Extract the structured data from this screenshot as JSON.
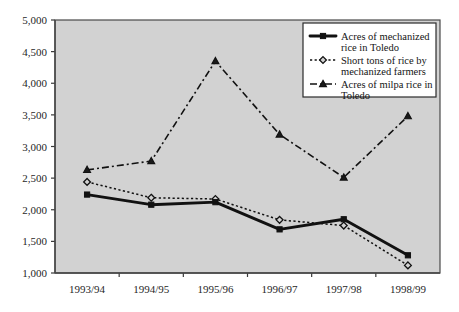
{
  "chart_data": {
    "type": "line",
    "title": "",
    "subtitle": "",
    "xlabel": "",
    "ylabel": "",
    "categories": [
      "1993/94",
      "1994/95",
      "1995/96",
      "1996/97",
      "1997/98",
      "1998/99"
    ],
    "ylim": [
      1000,
      5000
    ],
    "ytick_labels": [
      "5,000",
      "4,500",
      "4,000",
      "3,500",
      "3,000",
      "2,500",
      "2,000",
      "1,500",
      "1,000"
    ],
    "ytick_values": [
      5000,
      4500,
      4000,
      3500,
      3000,
      2500,
      2000,
      1500,
      1000
    ],
    "grid": false,
    "legend_position": "top-right",
    "series": [
      {
        "name": "Acres of mechanized rice in Toledo",
        "marker": "square",
        "line_style": "solid",
        "values": [
          2240,
          2080,
          2120,
          1690,
          1850,
          1280
        ]
      },
      {
        "name": "Short tons of rice by mechanized farmers",
        "marker": "diamond",
        "line_style": "dotted",
        "values": [
          2440,
          2190,
          2170,
          1840,
          1750,
          1120
        ]
      },
      {
        "name": "Acres of milpa rice in Toledo",
        "marker": "triangle",
        "line_style": "dash-dot",
        "values": [
          2630,
          2770,
          4350,
          3190,
          2510,
          3480
        ]
      }
    ]
  },
  "legend": {
    "entries": [
      {
        "line1": "Acres of mechanized",
        "line2": "rice in Toledo"
      },
      {
        "line1": "Short tons of rice by",
        "line2": "mechanized farmers"
      },
      {
        "line1": "Acres of milpa rice in",
        "line2": "Toledo"
      }
    ]
  },
  "colors": {
    "plot_background": "#d2d2d2",
    "page_background": "#ffffff",
    "line": "#111111",
    "axis": "#3a3a3a",
    "legend_background": "#ffffff"
  }
}
